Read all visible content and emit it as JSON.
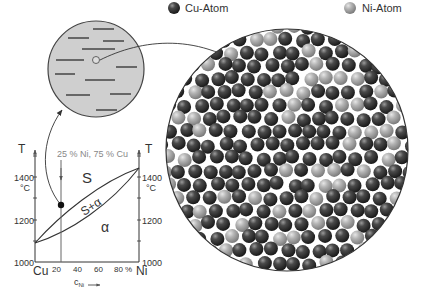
{
  "legend": {
    "cu_label": "Cu-Atom",
    "ni_label": "Ni-Atom",
    "cu_color": "#3a3a3a",
    "ni_color": "#a8a8a8"
  },
  "composition_label": "25 % Ni, 75 % Cu",
  "phase_diagram": {
    "y_axis_symbol": "T",
    "y_unit": "°C",
    "y_ticks": [
      "1000",
      "1200",
      "1400"
    ],
    "x_ticks": [
      "20",
      "40",
      "60",
      "80 %"
    ],
    "x_left": "Cu",
    "x_right": "Ni",
    "x_label": "c",
    "x_label_sub": "Ni",
    "regions": {
      "liquid": "S",
      "two_phase": "S+α",
      "solid": "α"
    }
  },
  "chart_data": {
    "type": "line",
    "xlabel": "c_Ni (%)",
    "ylabel": "T (°C)",
    "xlim": [
      0,
      100
    ],
    "ylim": [
      1000,
      1500
    ],
    "series": [
      {
        "name": "liquidus",
        "x": [
          0,
          25,
          50,
          75,
          100
        ],
        "y": [
          1083,
          1240,
          1330,
          1400,
          1453
        ]
      },
      {
        "name": "solidus",
        "x": [
          0,
          25,
          50,
          75,
          100
        ],
        "y": [
          1083,
          1150,
          1240,
          1340,
          1453
        ]
      }
    ],
    "annotations": [
      "S",
      "S+α",
      "α",
      "25 % Ni, 75 % Cu"
    ],
    "marker": {
      "x": 25,
      "y": 1270
    }
  }
}
